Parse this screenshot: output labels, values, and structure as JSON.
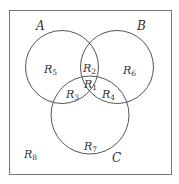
{
  "diagram": {
    "type": "venn-3-sets",
    "stroke_color": "#555555",
    "frame_color": "#777777",
    "sets": [
      {
        "id": "A",
        "label": "A"
      },
      {
        "id": "B",
        "label": "B"
      },
      {
        "id": "C",
        "label": "C"
      }
    ],
    "regions": [
      {
        "id": "R1",
        "base": "R",
        "sub": "1"
      },
      {
        "id": "R2",
        "base": "R",
        "sub": "2"
      },
      {
        "id": "R3",
        "base": "R",
        "sub": "3"
      },
      {
        "id": "R4",
        "base": "R",
        "sub": "4"
      },
      {
        "id": "R5",
        "base": "R",
        "sub": "5"
      },
      {
        "id": "R6",
        "base": "R",
        "sub": "6"
      },
      {
        "id": "R7",
        "base": "R",
        "sub": "7"
      },
      {
        "id": "R8",
        "base": "R",
        "sub": "8"
      }
    ]
  }
}
